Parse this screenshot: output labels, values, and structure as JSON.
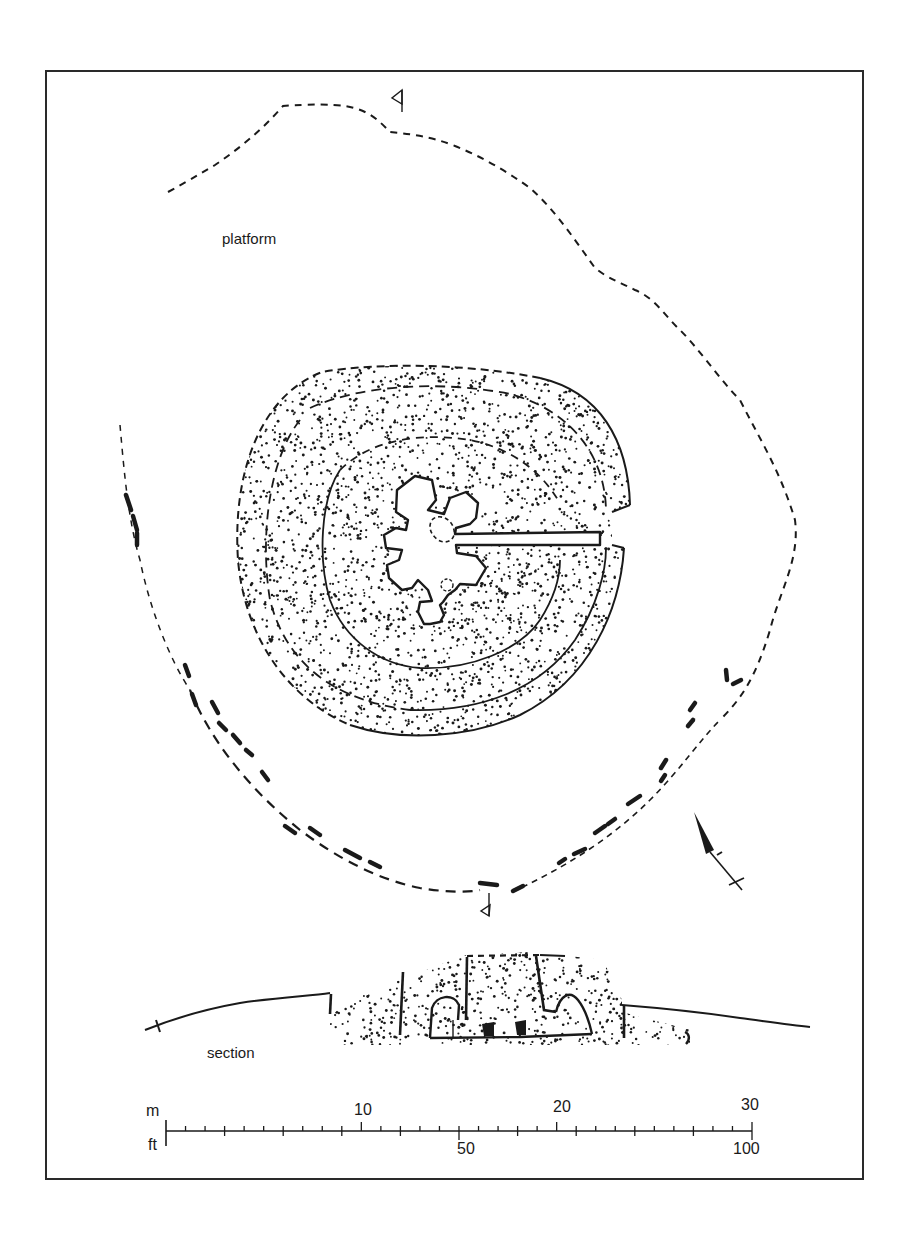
{
  "figure": {
    "labels": {
      "platform": "platform",
      "section": "section"
    },
    "north_arrow": {
      "icon": "north-arrow-icon",
      "bearing_deg": -28
    },
    "section_markers": {
      "icon": "section-marker-icon",
      "count": 2
    },
    "scale_bar": {
      "metric_unit": "m",
      "imperial_unit": "ft",
      "metric_ticks": [
        "10",
        "20",
        "30"
      ],
      "imperial_ticks": [
        "50",
        "100"
      ],
      "metric_max": 30,
      "imperial_max": 100
    },
    "colors": {
      "ink": "#1a1a1a",
      "paper": "#ffffff",
      "frame": "#2a2a2a"
    }
  }
}
